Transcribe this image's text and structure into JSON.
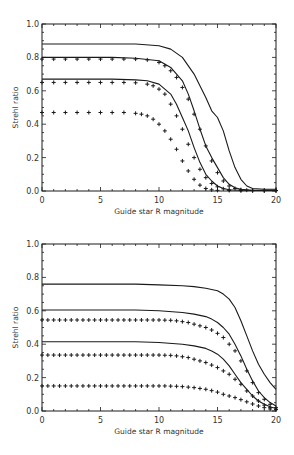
{
  "chart_data": [
    {
      "type": "line",
      "panel": "top",
      "title": "",
      "xlabel": "Guide star R magnitude",
      "ylabel": "Strehl ratio",
      "xlim": [
        0,
        20
      ],
      "ylim": [
        0,
        1.0
      ],
      "xticks": [
        0,
        5,
        10,
        15,
        20
      ],
      "xtick_labels": [
        "0",
        "5",
        "10",
        "15",
        "20"
      ],
      "yticks": [
        0.0,
        0.2,
        0.4,
        0.6,
        0.8,
        1.0
      ],
      "ytick_labels": [
        "0.0",
        "0.2",
        "0.4",
        "0.6",
        "0.8",
        "1.0"
      ],
      "grid": false,
      "legend": null,
      "series": [
        {
          "name": "solid-1",
          "style": "solid",
          "x": [
            0,
            2,
            4,
            6,
            8,
            10,
            11,
            12,
            13,
            14,
            14.5,
            15,
            15.5,
            16,
            16.5,
            17,
            17.5,
            18,
            19,
            20
          ],
          "y": [
            0.88,
            0.88,
            0.88,
            0.88,
            0.88,
            0.87,
            0.85,
            0.8,
            0.7,
            0.56,
            0.48,
            0.44,
            0.36,
            0.24,
            0.14,
            0.07,
            0.03,
            0.015,
            0.01,
            0.01
          ]
        },
        {
          "name": "plus-1",
          "style": "plus",
          "x": [
            0,
            1,
            2,
            3,
            4,
            5,
            6,
            7,
            8,
            9,
            10,
            10.5,
            11,
            11.5,
            12,
            12.5,
            13,
            13.5,
            14,
            14.5,
            15,
            15.5,
            16,
            16.5,
            17,
            17.5,
            18,
            19,
            20
          ],
          "y": [
            0.79,
            0.79,
            0.79,
            0.79,
            0.79,
            0.79,
            0.79,
            0.79,
            0.79,
            0.785,
            0.77,
            0.75,
            0.72,
            0.68,
            0.62,
            0.55,
            0.46,
            0.37,
            0.27,
            0.18,
            0.11,
            0.06,
            0.03,
            0.015,
            0.008,
            0.005,
            0.004,
            0.003,
            0.003
          ]
        },
        {
          "name": "solid-2",
          "style": "solid",
          "x": [
            0,
            2,
            4,
            6,
            8,
            10,
            11,
            12,
            12.5,
            13,
            13.5,
            14,
            14.5,
            15,
            15.5,
            16,
            16.5,
            17,
            18,
            19,
            20
          ],
          "y": [
            0.8,
            0.8,
            0.8,
            0.8,
            0.795,
            0.78,
            0.74,
            0.66,
            0.58,
            0.48,
            0.37,
            0.27,
            0.2,
            0.14,
            0.08,
            0.04,
            0.02,
            0.01,
            0.005,
            0.005,
            0.005
          ]
        },
        {
          "name": "solid-3",
          "style": "solid",
          "x": [
            0,
            2,
            4,
            6,
            8,
            9,
            10,
            11,
            11.5,
            12,
            12.5,
            13,
            13.5,
            14,
            14.5,
            15,
            15.5,
            16,
            17,
            18,
            20
          ],
          "y": [
            0.67,
            0.67,
            0.67,
            0.67,
            0.665,
            0.66,
            0.64,
            0.58,
            0.52,
            0.44,
            0.36,
            0.26,
            0.17,
            0.1,
            0.06,
            0.03,
            0.015,
            0.008,
            0.004,
            0.003,
            0.003
          ]
        },
        {
          "name": "plus-2",
          "style": "plus",
          "x": [
            0,
            1,
            2,
            3,
            4,
            5,
            6,
            7,
            8,
            9,
            9.5,
            10,
            10.5,
            11,
            11.5,
            12,
            12.5,
            13,
            13.5,
            14,
            14.5,
            15,
            15.5,
            16,
            17,
            18,
            19,
            20
          ],
          "y": [
            0.65,
            0.65,
            0.65,
            0.65,
            0.65,
            0.65,
            0.65,
            0.65,
            0.648,
            0.64,
            0.63,
            0.61,
            0.58,
            0.52,
            0.45,
            0.37,
            0.28,
            0.2,
            0.13,
            0.08,
            0.045,
            0.025,
            0.013,
            0.007,
            0.004,
            0.003,
            0.003,
            0.003
          ]
        },
        {
          "name": "plus-3",
          "style": "plus",
          "x": [
            0,
            1,
            2,
            3,
            4,
            5,
            6,
            7,
            8,
            8.5,
            9,
            9.5,
            10,
            10.5,
            11,
            11.5,
            12,
            12.5,
            13,
            13.5,
            14,
            14.5,
            15,
            16,
            17,
            18,
            19,
            20
          ],
          "y": [
            0.47,
            0.47,
            0.47,
            0.47,
            0.47,
            0.47,
            0.47,
            0.47,
            0.465,
            0.46,
            0.45,
            0.43,
            0.4,
            0.36,
            0.31,
            0.25,
            0.18,
            0.12,
            0.07,
            0.035,
            0.015,
            0.007,
            0.004,
            0.003,
            0.002,
            0.002,
            0.002,
            0.002
          ]
        }
      ]
    },
    {
      "type": "line",
      "panel": "bottom",
      "title": "",
      "xlabel": "Guide star R magnitude",
      "ylabel": "Strehl ratio",
      "xlim": [
        0,
        20
      ],
      "ylim": [
        0,
        1.0
      ],
      "xticks": [
        0,
        5,
        10,
        15,
        20
      ],
      "xtick_labels": [
        "0",
        "5",
        "10",
        "15",
        "20"
      ],
      "yticks": [
        0.0,
        0.2,
        0.4,
        0.6,
        0.8,
        1.0
      ],
      "ytick_labels": [
        "0.0",
        "0.2",
        "0.4",
        "0.6",
        "0.8",
        "1.0"
      ],
      "grid": false,
      "legend": null,
      "series": [
        {
          "name": "solid-1",
          "style": "solid",
          "x": [
            0,
            2,
            4,
            6,
            8,
            10,
            12,
            13,
            14,
            15,
            15.5,
            16,
            16.5,
            17,
            17.5,
            18,
            18.5,
            19,
            19.5,
            20
          ],
          "y": [
            0.76,
            0.76,
            0.76,
            0.76,
            0.76,
            0.755,
            0.75,
            0.745,
            0.735,
            0.72,
            0.7,
            0.67,
            0.62,
            0.54,
            0.45,
            0.36,
            0.28,
            0.22,
            0.17,
            0.13
          ]
        },
        {
          "name": "solid-2",
          "style": "solid",
          "x": [
            0,
            2,
            4,
            6,
            8,
            10,
            12,
            13,
            14,
            14.5,
            15,
            15.5,
            16,
            16.5,
            17,
            17.5,
            18,
            18.5,
            19,
            19.5,
            20
          ],
          "y": [
            0.605,
            0.605,
            0.605,
            0.605,
            0.605,
            0.6,
            0.59,
            0.58,
            0.565,
            0.55,
            0.53,
            0.5,
            0.46,
            0.4,
            0.33,
            0.25,
            0.18,
            0.12,
            0.08,
            0.05,
            0.03
          ]
        },
        {
          "name": "plus-1",
          "style": "plus",
          "x": [
            0,
            0.5,
            1,
            1.5,
            2,
            2.5,
            3,
            3.5,
            4,
            4.5,
            5,
            5.5,
            6,
            6.5,
            7,
            7.5,
            8,
            8.5,
            9,
            9.5,
            10,
            10.5,
            11,
            11.5,
            12,
            12.5,
            13,
            13.5,
            14,
            14.5,
            15,
            15.5,
            16,
            16.5,
            17,
            17.5,
            18,
            18.5,
            19,
            19.5,
            20
          ],
          "y": [
            0.545,
            0.545,
            0.545,
            0.545,
            0.545,
            0.545,
            0.545,
            0.545,
            0.545,
            0.545,
            0.545,
            0.545,
            0.545,
            0.545,
            0.545,
            0.545,
            0.545,
            0.545,
            0.545,
            0.545,
            0.545,
            0.544,
            0.543,
            0.54,
            0.535,
            0.53,
            0.52,
            0.51,
            0.5,
            0.485,
            0.465,
            0.44,
            0.4,
            0.36,
            0.3,
            0.24,
            0.17,
            0.11,
            0.07,
            0.04,
            0.02
          ]
        },
        {
          "name": "solid-3",
          "style": "solid",
          "x": [
            0,
            2,
            4,
            6,
            8,
            10,
            12,
            13,
            14,
            14.5,
            15,
            15.5,
            16,
            16.5,
            17,
            17.5,
            18,
            18.5,
            19,
            19.5,
            20
          ],
          "y": [
            0.415,
            0.415,
            0.415,
            0.415,
            0.415,
            0.41,
            0.4,
            0.39,
            0.375,
            0.36,
            0.34,
            0.31,
            0.27,
            0.22,
            0.17,
            0.13,
            0.09,
            0.06,
            0.04,
            0.025,
            0.015
          ]
        },
        {
          "name": "plus-2",
          "style": "plus",
          "x": [
            0,
            0.5,
            1,
            1.5,
            2,
            2.5,
            3,
            3.5,
            4,
            4.5,
            5,
            5.5,
            6,
            6.5,
            7,
            7.5,
            8,
            8.5,
            9,
            9.5,
            10,
            10.5,
            11,
            11.5,
            12,
            12.5,
            13,
            13.5,
            14,
            14.5,
            15,
            15.5,
            16,
            16.5,
            17,
            17.5,
            18,
            18.5,
            19,
            19.5,
            20
          ],
          "y": [
            0.335,
            0.335,
            0.335,
            0.335,
            0.335,
            0.335,
            0.335,
            0.335,
            0.335,
            0.335,
            0.335,
            0.335,
            0.335,
            0.335,
            0.335,
            0.335,
            0.335,
            0.335,
            0.335,
            0.335,
            0.335,
            0.334,
            0.333,
            0.33,
            0.325,
            0.32,
            0.31,
            0.3,
            0.29,
            0.275,
            0.26,
            0.24,
            0.22,
            0.19,
            0.16,
            0.12,
            0.09,
            0.06,
            0.035,
            0.02,
            0.01
          ]
        },
        {
          "name": "plus-3",
          "style": "plus",
          "x": [
            0,
            0.5,
            1,
            1.5,
            2,
            2.5,
            3,
            3.5,
            4,
            4.5,
            5,
            5.5,
            6,
            6.5,
            7,
            7.5,
            8,
            8.5,
            9,
            9.5,
            10,
            10.5,
            11,
            11.5,
            12,
            12.5,
            13,
            13.5,
            14,
            14.5,
            15,
            15.5,
            16,
            16.5,
            17,
            17.5,
            18,
            18.5,
            19,
            19.5,
            20
          ],
          "y": [
            0.15,
            0.15,
            0.15,
            0.15,
            0.15,
            0.15,
            0.15,
            0.15,
            0.15,
            0.15,
            0.15,
            0.15,
            0.15,
            0.15,
            0.15,
            0.15,
            0.15,
            0.15,
            0.15,
            0.15,
            0.15,
            0.15,
            0.149,
            0.148,
            0.146,
            0.143,
            0.14,
            0.135,
            0.13,
            0.122,
            0.113,
            0.1,
            0.09,
            0.08,
            0.068,
            0.055,
            0.042,
            0.03,
            0.02,
            0.012,
            0.008
          ]
        }
      ]
    }
  ],
  "panels": [
    {
      "frame": {
        "x0": 42,
        "x1": 276,
        "y_top": 24,
        "y_bottom": 191
      }
    },
    {
      "frame": {
        "x0": 42,
        "x1": 276,
        "y_top": 244,
        "y_bottom": 411
      }
    }
  ],
  "colors": {
    "ink": "#1a1a1a",
    "text": "#333333",
    "background": "#ffffff"
  }
}
